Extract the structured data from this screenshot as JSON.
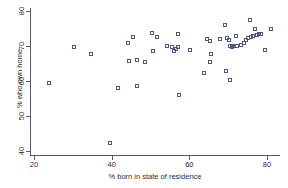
{
  "chart_data": {
    "type": "scatter",
    "title": "",
    "xlabel": "% born in state of residence",
    "ylabel": "% who own home",
    "xlim": [
      20,
      82
    ],
    "ylim": [
      39,
      80
    ],
    "xticks": [
      20,
      40,
      60,
      80
    ],
    "yticks": [
      40,
      50,
      60,
      70,
      80
    ],
    "grid": false,
    "legend": null,
    "marker": "open-square",
    "marker_color": "#515a7a",
    "series": [
      {
        "name": "states",
        "points": [
          [
            23.9,
            59.3
          ],
          [
            30.3,
            69.6
          ],
          [
            34.7,
            67.8
          ],
          [
            39.6,
            42.4
          ],
          [
            41.7,
            58.0
          ],
          [
            44.3,
            70.9
          ],
          [
            44.5,
            65.8
          ],
          [
            45.6,
            72.7
          ],
          [
            46.4,
            65.9
          ],
          [
            46.6,
            58.6
          ],
          [
            48.6,
            65.4
          ],
          [
            50.4,
            73.7
          ],
          [
            50.6,
            68.6
          ],
          [
            51.6,
            72.5
          ],
          [
            54.3,
            70.0
          ],
          [
            55.5,
            69.8
          ],
          [
            56.1,
            68.7
          ],
          [
            56.5,
            69.2
          ],
          [
            57.0,
            73.4
          ],
          [
            57.2,
            69.7
          ],
          [
            57.4,
            56.0
          ],
          [
            60.3,
            68.9
          ],
          [
            63.8,
            62.2
          ],
          [
            64.6,
            71.9
          ],
          [
            65.2,
            71.4
          ],
          [
            65.4,
            65.4
          ],
          [
            65.6,
            67.8
          ],
          [
            67.9,
            72.0
          ],
          [
            69.2,
            76.0
          ],
          [
            69.5,
            63.0
          ],
          [
            69.6,
            72.4
          ],
          [
            70.3,
            71.7
          ],
          [
            70.4,
            69.9
          ],
          [
            70.6,
            60.2
          ],
          [
            71.0,
            69.8
          ],
          [
            71.2,
            69.9
          ],
          [
            71.6,
            70.0
          ],
          [
            72.1,
            72.9
          ],
          [
            72.4,
            70.0
          ],
          [
            73.3,
            70.4
          ],
          [
            74.0,
            71.0
          ],
          [
            74.6,
            71.6
          ],
          [
            75.1,
            72.3
          ],
          [
            75.6,
            77.4
          ],
          [
            75.9,
            72.7
          ],
          [
            76.4,
            73.0
          ],
          [
            76.8,
            74.9
          ],
          [
            77.4,
            73.2
          ],
          [
            78.0,
            73.4
          ],
          [
            78.4,
            73.5
          ],
          [
            79.6,
            68.9
          ],
          [
            81.0,
            74.8
          ]
        ]
      }
    ]
  }
}
